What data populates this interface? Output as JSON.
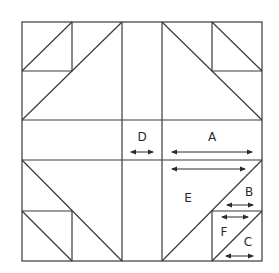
{
  "diagram": {
    "type": "quilt-block-cutting-diagram",
    "labels": {
      "A": "A",
      "B": "B",
      "C": "C",
      "D": "D",
      "E": "E",
      "F": "F"
    },
    "colors": {
      "line": "#3a3a3a",
      "background": "#ffffff"
    }
  }
}
